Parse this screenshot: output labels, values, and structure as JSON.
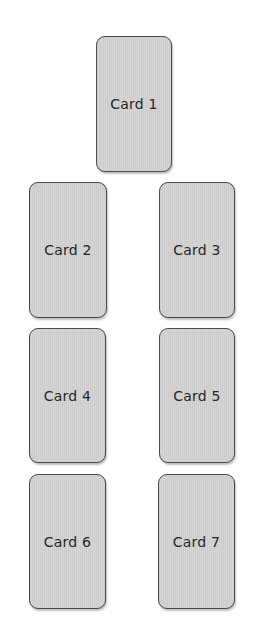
{
  "layout": {
    "title": "Card spread layout",
    "cards": [
      {
        "label": "Card 1",
        "x": 96,
        "y": 36,
        "w": 76,
        "h": 136
      },
      {
        "label": "Card 2",
        "x": 29,
        "y": 182,
        "w": 78,
        "h": 136
      },
      {
        "label": "Card 3",
        "x": 159,
        "y": 182,
        "w": 76,
        "h": 136
      },
      {
        "label": "Card 4",
        "x": 29,
        "y": 328,
        "w": 77,
        "h": 135
      },
      {
        "label": "Card 5",
        "x": 159,
        "y": 328,
        "w": 76,
        "h": 135
      },
      {
        "label": "Card 6",
        "x": 29,
        "y": 474,
        "w": 77,
        "h": 135
      },
      {
        "label": "Card 7",
        "x": 158,
        "y": 474,
        "w": 77,
        "h": 135
      }
    ]
  },
  "colors": {
    "card_fill": "#d3d3d3",
    "card_border": "#4a4a4a",
    "text": "#262626",
    "background": "#ffffff"
  }
}
